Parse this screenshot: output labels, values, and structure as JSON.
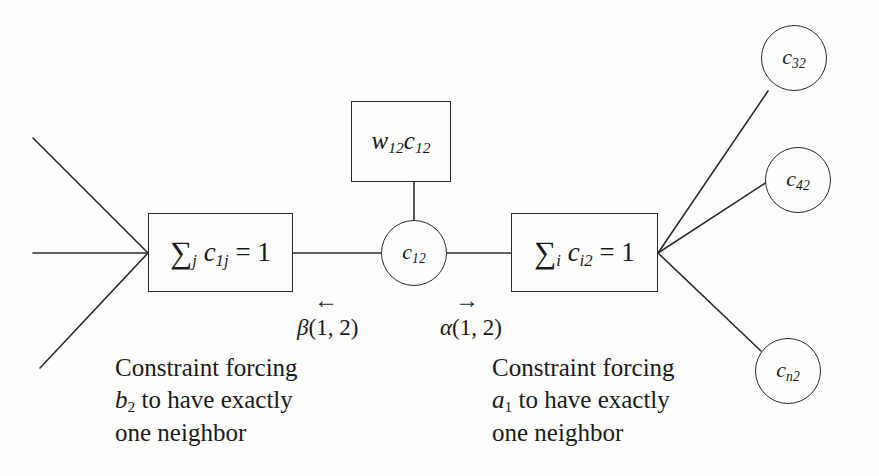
{
  "diagram": {
    "stroke_color": "#2b2b2b",
    "background": "#fdfdfc",
    "nodes": {
      "constraint_left": {
        "name": "sum-constraint-b2",
        "sum_symbol": "∑",
        "sum_subscript": "j",
        "variable": "c",
        "variable_subscript": "1j",
        "relation": "= 1"
      },
      "constraint_right": {
        "name": "sum-constraint-a1",
        "sum_symbol": "∑",
        "sum_subscript": "i",
        "variable": "c",
        "variable_subscript": "i2",
        "relation": "= 1"
      },
      "weight_factor": {
        "name": "weight-factor",
        "weight": "w",
        "weight_subscript": "12",
        "variable": "c",
        "variable_subscript": "12"
      },
      "variable_center": {
        "name": "variable-c12",
        "variable": "c",
        "subscript": "12"
      },
      "variable_c32": {
        "variable": "c",
        "subscript": "32"
      },
      "variable_c42": {
        "variable": "c",
        "subscript": "42"
      },
      "variable_cn2": {
        "variable": "c",
        "subscript": "n2"
      }
    },
    "messages": {
      "beta": {
        "arrow": "←",
        "symbol": "β",
        "args": "(1, 2)"
      },
      "alpha": {
        "arrow": "→",
        "symbol": "α",
        "args": "(1, 2)"
      }
    },
    "captions": {
      "left": {
        "line1": "Constraint forcing",
        "line2_var": "b",
        "line2_sub": "2",
        "line2_rest": " to have exactly",
        "line3": "one neighbor"
      },
      "right": {
        "line1": "Constraint forcing",
        "line2_var": "a",
        "line2_sub": "1",
        "line2_rest": " to have exactly",
        "line3": "one neighbor"
      }
    }
  }
}
